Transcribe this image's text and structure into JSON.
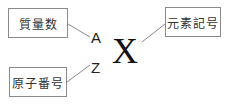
{
  "diagram": {
    "boxes": {
      "mass_number": "質量数",
      "atomic_number": "原子番号",
      "element_symbol": "元素記号"
    },
    "notation": {
      "mass": "A",
      "atomic": "Z",
      "symbol": "X"
    }
  }
}
